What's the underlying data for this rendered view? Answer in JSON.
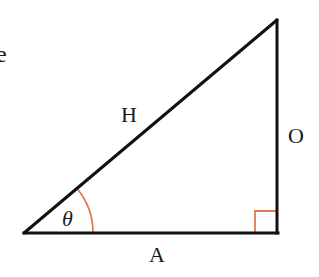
{
  "diagram": {
    "type": "right-triangle",
    "labels": {
      "hypotenuse": "H",
      "opposite": "O",
      "adjacent": "A",
      "angle": "θ",
      "partial_left": "e"
    },
    "colors": {
      "stroke": "#111111",
      "angle_marker": "#e07a4f",
      "background": "#ffffff"
    },
    "vertices": {
      "bottom_left": [
        24,
        233
      ],
      "bottom_right": [
        277,
        233
      ],
      "top_right": [
        277,
        20
      ]
    },
    "right_angle_marker_size": 22,
    "angle_arc_radius": 69
  }
}
